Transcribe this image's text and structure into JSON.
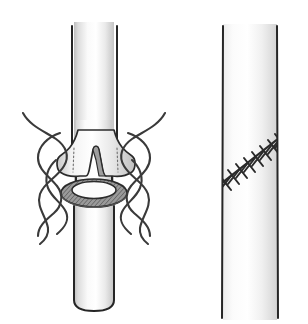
{
  "figure": {
    "background_color": "#ffffff",
    "width": 308,
    "height": 324,
    "panel_count": 2,
    "caption": ""
  },
  "panels": [
    {
      "id": "left-panel",
      "name": "anastomosis-in-progress",
      "description": "Vessel end everted as a cuff over a ring connector with untied suture threads on both sides",
      "vessel": {
        "name": "blood-vessel-tube",
        "left_edge_x": 72,
        "right_edge_x": 117,
        "top_y": 22,
        "bottom_y": 312,
        "outline_color": "#262626",
        "fill_light": "#ffffff",
        "fill_shadow": "#c9c9c9"
      },
      "cuff": {
        "name": "everted-vessel-cuff",
        "top_y": 128,
        "bottom_y": 178,
        "left_x": 56,
        "right_x": 132,
        "notch_label": "central notch",
        "fill_light": "#fdfdfd",
        "fill_shadow": "#bdbdbd"
      },
      "ring": {
        "name": "anastomosis-ring-connector",
        "center_x": 94,
        "center_y": 193,
        "radius_x": 32,
        "radius_y": 13,
        "band_color": "#8a8a8a",
        "outline_color": "#2b2b2b",
        "texture": "hatched"
      },
      "threads": {
        "name": "suture-threads",
        "count_left": 3,
        "count_right": 3,
        "color": "#3a3a3a",
        "state": "untied"
      }
    },
    {
      "id": "right-panel",
      "name": "completed-anastomosis",
      "description": "Vessel with completed oblique interrupted suture line",
      "vessel": {
        "name": "blood-vessel-tube",
        "left_edge_x": 222,
        "right_edge_x": 277,
        "top_y": 26,
        "bottom_y": 318,
        "outline_color": "#262626",
        "fill_light": "#ffffff",
        "fill_shadow": "#d2d2d2"
      },
      "suture_line": {
        "name": "oblique-suture-line",
        "start_x": 224,
        "start_y": 182,
        "end_x": 284,
        "end_y": 135,
        "stitch_count": 8,
        "stitch_type": "interrupted-cross",
        "color": "#2a2a2a"
      }
    }
  ],
  "colors": {
    "ink": "#262626",
    "thread": "#3a3a3a",
    "ring_band": "#8a8a8a",
    "vessel_shadow": "#c9c9c9",
    "paper": "#ffffff"
  }
}
